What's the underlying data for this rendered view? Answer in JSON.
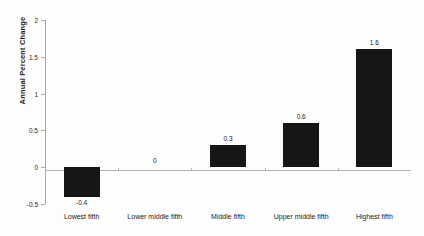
{
  "chart_data": {
    "type": "bar",
    "title": "",
    "xlabel": "",
    "ylabel": "Annual Percent Change",
    "categories": [
      "Lowest fifth",
      "Lower middle fifth",
      "Middle fifth",
      "Upper middle fifth",
      "Highest fifth"
    ],
    "values": [
      -0.4,
      0,
      0.3,
      0.6,
      1.6
    ],
    "value_labels": [
      "-0.4",
      "0",
      "0.3",
      "0.6",
      "1.6"
    ],
    "ylim": [
      -0.5,
      2
    ],
    "yticks": [
      2,
      1.5,
      1,
      0.5,
      0,
      -0.5
    ],
    "ytick_labels": [
      "2",
      "1.5",
      "1",
      "0.5",
      "0",
      "-0.5"
    ],
    "grid": false,
    "legend": "none",
    "bar_color": "#161616",
    "axis_color": "#a9a9a9",
    "background_color": "#fdfdfd"
  },
  "axis": {
    "y_title": "Annual Percent Change"
  },
  "ticks": {
    "y": [
      {
        "label": "2"
      },
      {
        "label": "1.5"
      },
      {
        "label": "1"
      },
      {
        "label": "0.5"
      },
      {
        "label": "0"
      },
      {
        "label": "-0.5"
      }
    ]
  },
  "bars": [
    {
      "category": "Lowest fifth",
      "value_label": "-0.4"
    },
    {
      "category": "Lower middle fifth",
      "value_label": "0"
    },
    {
      "category": "Middle fifth",
      "value_label": "0.3"
    },
    {
      "category": "Upper middle fifth",
      "value_label": "0.6"
    },
    {
      "category": "Highest fifth",
      "value_label": "1.6"
    }
  ]
}
